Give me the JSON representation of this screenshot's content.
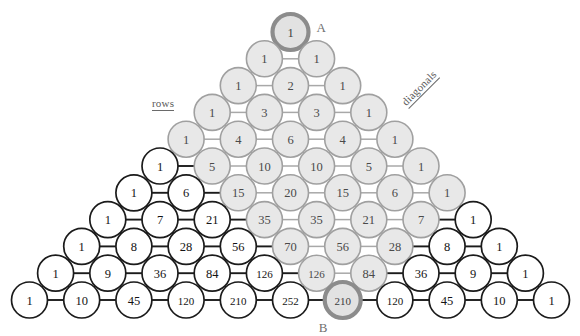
{
  "figure": {
    "kind": "pascals-triangle",
    "annotations": {
      "rows_label": "rows",
      "diagonals_label": "diagonals",
      "point_a_label": "A",
      "point_b_label": "B"
    },
    "colors": {
      "shaded_fill": "#e8e8e8",
      "shaded_stroke": "#a0a0a0",
      "plain_fill": "#ffffff",
      "plain_stroke": "#1b1b1b",
      "marked_stroke": "#8c8c8c",
      "background": "#ffffff"
    }
  },
  "chart_data": {
    "type": "diagram",
    "xlabel": "diagonals",
    "ylabel": "rows",
    "rows": 11,
    "values": [
      [
        1
      ],
      [
        1,
        1
      ],
      [
        1,
        2,
        1
      ],
      [
        1,
        3,
        3,
        1
      ],
      [
        1,
        4,
        6,
        4,
        1
      ],
      [
        1,
        5,
        10,
        10,
        5,
        1
      ],
      [
        1,
        6,
        15,
        20,
        15,
        6,
        1
      ],
      [
        1,
        7,
        21,
        35,
        35,
        21,
        7,
        1
      ],
      [
        1,
        8,
        28,
        56,
        70,
        56,
        28,
        8,
        1
      ],
      [
        1,
        9,
        36,
        84,
        126,
        126,
        84,
        36,
        9,
        1
      ],
      [
        1,
        10,
        45,
        120,
        210,
        252,
        210,
        120,
        45,
        10,
        1
      ]
    ],
    "shaded": [
      [
        true
      ],
      [
        true,
        true
      ],
      [
        true,
        true,
        true
      ],
      [
        true,
        true,
        true,
        true
      ],
      [
        true,
        true,
        true,
        true,
        true
      ],
      [
        false,
        true,
        true,
        true,
        true,
        true
      ],
      [
        false,
        false,
        true,
        true,
        true,
        true,
        true
      ],
      [
        false,
        false,
        false,
        true,
        true,
        true,
        true,
        false
      ],
      [
        false,
        false,
        false,
        false,
        true,
        true,
        true,
        false,
        false
      ],
      [
        false,
        false,
        false,
        false,
        false,
        true,
        true,
        false,
        false,
        false
      ],
      [
        false,
        false,
        false,
        false,
        false,
        false,
        true,
        false,
        false,
        false,
        false
      ]
    ],
    "marked": {
      "A": {
        "row": 0,
        "index": 0
      },
      "B": {
        "row": 10,
        "index": 6
      }
    },
    "marked_values": {
      "A": 1,
      "B": 210
    },
    "legend": [
      "rows",
      "diagonals"
    ],
    "grid": false
  }
}
